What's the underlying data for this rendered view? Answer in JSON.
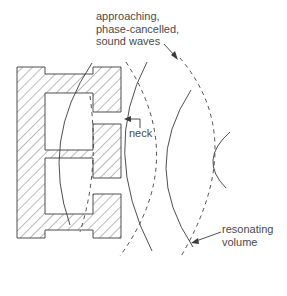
{
  "diagram": {
    "labels": {
      "waves": [
        "approaching,",
        "phase-cancelled,",
        "sound waves"
      ],
      "neck": "neck",
      "volume": [
        "resonating",
        "volume"
      ]
    },
    "colors": {
      "line": "#3a3a3a",
      "hatch": "#555555",
      "text": "#4a4a4a",
      "background": "#ffffff"
    }
  }
}
